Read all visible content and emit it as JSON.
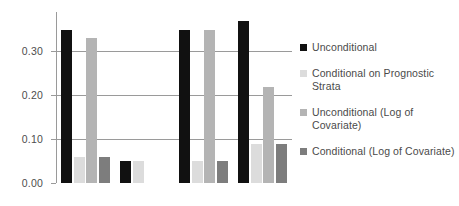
{
  "chart_data": {
    "type": "bar",
    "title": "",
    "xlabel": "",
    "ylabel": "",
    "ylim": [
      0.0,
      0.39
    ],
    "grid": true,
    "legend_position": "right",
    "categories": [
      "Group 1",
      "Group 2",
      "Group 3",
      "Group 4"
    ],
    "ytick_labels": [
      "0.00",
      "0.10",
      "0.20",
      "0.30"
    ],
    "ytick_values": [
      0.0,
      0.1,
      0.2,
      0.3
    ],
    "series": [
      {
        "name": "Unconditional",
        "color": "#111111",
        "values": [
          0.35,
          0.05,
          0.35,
          0.37
        ]
      },
      {
        "name": "Conditional on Prognostic Strata",
        "color": "#dcdcdc",
        "values": [
          0.06,
          0.05,
          0.05,
          0.09
        ]
      },
      {
        "name": "Unconditional (Log of Covariate)",
        "color": "#b4b4b4",
        "values": [
          0.33,
          0.0,
          0.35,
          0.22
        ]
      },
      {
        "name": "Conditional (Log of Covariate)",
        "color": "#7d7d7d",
        "values": [
          0.06,
          0.0,
          0.05,
          0.09
        ]
      }
    ]
  },
  "legend": {
    "items": [
      {
        "label": "Unconditional",
        "color": "#111111"
      },
      {
        "label": "Conditional on Prognostic Strata",
        "color": "#dcdcdc"
      },
      {
        "label": "Unconditional (Log of Covariate)",
        "color": "#b4b4b4"
      },
      {
        "label": "Conditional (Log of Covariate)",
        "color": "#7d7d7d"
      }
    ]
  }
}
